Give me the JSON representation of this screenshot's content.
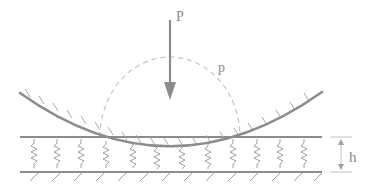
{
  "diagram": {
    "type": "contact-mechanics",
    "labels": {
      "load": "P",
      "pressure": "p",
      "thickness": "h"
    },
    "colors": {
      "line": "#8c8c8c",
      "hatch": "#a0a0a0",
      "dashed": "#c4c4c4",
      "text": "#8a8a8a"
    },
    "spring_positions_x": [
      34,
      57,
      81,
      106,
      133,
      157,
      182,
      208,
      233,
      257,
      280,
      304
    ],
    "top_plate_y": 137,
    "bottom_plate_y": 172
  }
}
